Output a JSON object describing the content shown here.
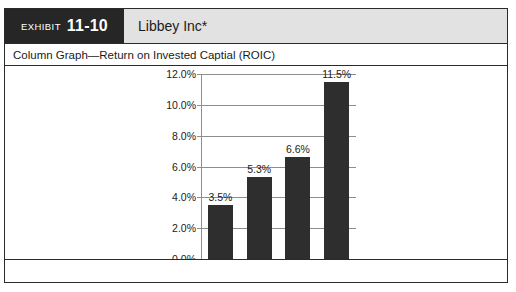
{
  "exhibit": {
    "label": "EXHIBIT",
    "number": "11-10",
    "company": "Libbey Inc*",
    "subtitle": "Column Graph—Return on Invested Captial (ROIC)",
    "footnote": "",
    "colors": {
      "tab_background": "#262626",
      "header_background": "#e2e2e2",
      "border": "#2b2b2b",
      "bar": "#2e2e2e",
      "gridline": "#8d8d8d"
    }
  },
  "chart_data": {
    "type": "bar",
    "title": "Column Graph—Return on Invested Captial (ROIC)",
    "xlabel": "",
    "ylabel": "",
    "categories": [
      "2005",
      "2008",
      "2009",
      "2010"
    ],
    "values": [
      3.5,
      5.3,
      6.6,
      11.5
    ],
    "data_labels": [
      "3.5%",
      "5.3%",
      "6.6%",
      "11.5%"
    ],
    "ylim": [
      0,
      12
    ],
    "ytick_values": [
      0,
      2,
      4,
      6,
      8,
      10,
      12
    ],
    "ytick_labels": [
      "0.0%",
      "2.0%",
      "4.0%",
      "6.0%",
      "8.0%",
      "10.0%",
      "12.0%"
    ],
    "grid": true,
    "legend": false,
    "legend_position": "none",
    "series": [
      {
        "name": "ROIC",
        "values": [
          3.5,
          5.3,
          6.6,
          11.5
        ]
      }
    ]
  }
}
